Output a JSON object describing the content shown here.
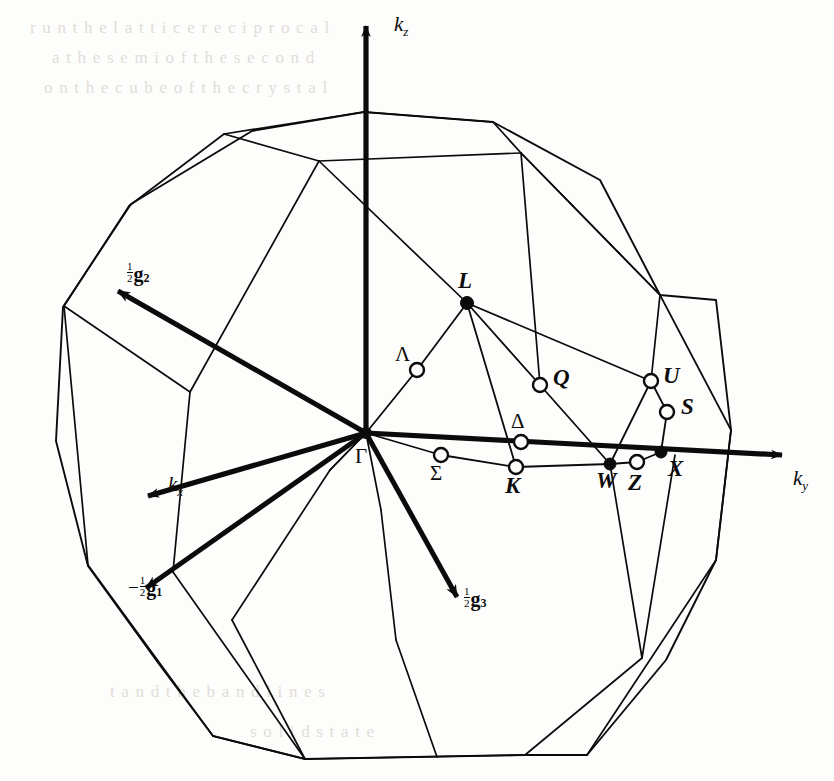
{
  "figure": {
    "type": "brillouin-zone-diagram",
    "lattice": "face-centred cubic",
    "zone_shape": "truncated octahedron",
    "background_color": "#fdfdfc",
    "ink_color": "#0b0b0b"
  },
  "axes": [
    {
      "id": "kz",
      "label": "k",
      "sub": "z",
      "label_x": 394,
      "label_y": 12,
      "from": [
        366,
        433
      ],
      "to": [
        366,
        26
      ],
      "style": "thick-arrow"
    },
    {
      "id": "ky",
      "label": "k",
      "sub": "y",
      "label_x": 793,
      "label_y": 466,
      "from": [
        366,
        433
      ],
      "to": [
        782,
        455
      ],
      "style": "thick-arrow"
    },
    {
      "id": "kx",
      "label": "k",
      "sub": "x",
      "label_x": 168,
      "label_y": 472,
      "from": [
        366,
        433
      ],
      "to": [
        148,
        496
      ],
      "style": "thick-arrow"
    }
  ],
  "reciprocal_vectors": [
    {
      "id": "half-g2",
      "sign": "",
      "numerator": "1",
      "denominator": "2",
      "symbol": "g",
      "subscript": "2",
      "label_x": 127,
      "label_y": 262,
      "from": [
        366,
        433
      ],
      "to": [
        118,
        291
      ]
    },
    {
      "id": "neg-half-g1",
      "sign": "−",
      "numerator": "1",
      "denominator": "2",
      "symbol": "g",
      "subscript": "1",
      "label_x": 128,
      "label_y": 576,
      "from": [
        366,
        433
      ],
      "to": [
        146,
        588
      ]
    },
    {
      "id": "half-g3",
      "sign": "",
      "numerator": "1",
      "denominator": "2",
      "symbol": "g",
      "subscript": "3",
      "label_x": 464,
      "label_y": 587,
      "from": [
        366,
        433
      ],
      "to": [
        457,
        597
      ]
    }
  ],
  "symmetry_points": [
    {
      "id": "gamma",
      "label": "Γ",
      "style": "greek",
      "marker": "filled",
      "x": 366,
      "y": 433,
      "label_x": 355,
      "label_y": 444,
      "r": 5.5
    },
    {
      "id": "L",
      "label": "L",
      "style": "italic",
      "marker": "filled",
      "x": 467,
      "y": 303,
      "label_x": 458,
      "label_y": 268,
      "r": 6.5
    },
    {
      "id": "W",
      "label": "W",
      "style": "italic",
      "marker": "filled",
      "x": 610,
      "y": 464,
      "label_x": 596,
      "label_y": 468,
      "r": 6.0
    },
    {
      "id": "X",
      "label": "X",
      "style": "italic",
      "marker": "filled",
      "x": 661,
      "y": 452,
      "label_x": 668,
      "label_y": 456,
      "r": 6.0
    },
    {
      "id": "lambda",
      "label": "Λ",
      "style": "greek",
      "marker": "open",
      "x": 417,
      "y": 370,
      "label_x": 395,
      "label_y": 342,
      "r": 7.0
    },
    {
      "id": "Q",
      "label": "Q",
      "style": "italic",
      "marker": "open",
      "x": 540,
      "y": 385,
      "label_x": 553,
      "label_y": 365,
      "r": 7.0
    },
    {
      "id": "U",
      "label": "U",
      "style": "italic",
      "marker": "open",
      "x": 651,
      "y": 381,
      "label_x": 663,
      "label_y": 363,
      "r": 7.0
    },
    {
      "id": "S",
      "label": "S",
      "style": "italic",
      "marker": "open",
      "x": 667,
      "y": 412,
      "label_x": 681,
      "label_y": 394,
      "r": 7.0
    },
    {
      "id": "delta",
      "label": "Δ",
      "style": "greek",
      "marker": "open",
      "x": 521,
      "y": 442,
      "label_x": 511,
      "label_y": 409,
      "r": 7.0
    },
    {
      "id": "sigma",
      "label": "Σ",
      "style": "greek",
      "marker": "open",
      "x": 441,
      "y": 455,
      "label_x": 430,
      "label_y": 461,
      "r": 7.0
    },
    {
      "id": "K",
      "label": "K",
      "style": "italic",
      "marker": "open",
      "x": 516,
      "y": 467,
      "label_x": 505,
      "label_y": 473,
      "r": 7.0
    },
    {
      "id": "Z",
      "label": "Z",
      "style": "italic",
      "marker": "open",
      "x": 637,
      "y": 462,
      "label_x": 628,
      "label_y": 470,
      "r": 7.0
    }
  ],
  "internal_lines": [
    {
      "id": "gamma-lambda-L",
      "points": [
        [
          366,
          433
        ],
        [
          417,
          370
        ],
        [
          467,
          303
        ]
      ]
    },
    {
      "id": "gamma-sigma-K",
      "points": [
        [
          366,
          433
        ],
        [
          441,
          455
        ],
        [
          516,
          467
        ]
      ]
    },
    {
      "id": "L-K",
      "points": [
        [
          467,
          303
        ],
        [
          516,
          467
        ]
      ]
    },
    {
      "id": "L-Q-W",
      "points": [
        [
          467,
          303
        ],
        [
          540,
          385
        ],
        [
          610,
          464
        ]
      ]
    },
    {
      "id": "L-U",
      "points": [
        [
          467,
          303
        ],
        [
          651,
          381
        ]
      ]
    },
    {
      "id": "K-W",
      "points": [
        [
          516,
          467
        ],
        [
          610,
          464
        ]
      ]
    },
    {
      "id": "U-S-X",
      "points": [
        [
          651,
          381
        ],
        [
          667,
          412
        ],
        [
          661,
          452
        ]
      ]
    },
    {
      "id": "W-Z-X",
      "points": [
        [
          610,
          464
        ],
        [
          637,
          462
        ],
        [
          661,
          452
        ]
      ]
    },
    {
      "id": "U-W",
      "points": [
        [
          651,
          381
        ],
        [
          610,
          464
        ]
      ]
    }
  ],
  "zone_outline": {
    "id": "truncated-octahedron",
    "silhouette": [
      [
        364,
        112
      ],
      [
        252,
        131
      ],
      [
        131,
        204
      ],
      [
        63,
        307
      ],
      [
        56,
        441
      ],
      [
        88,
        566
      ],
      [
        159,
        664
      ],
      [
        213,
        736
      ],
      [
        305,
        759
      ],
      [
        525,
        755
      ],
      [
        587,
        755
      ],
      [
        666,
        660
      ],
      [
        716,
        560
      ],
      [
        731,
        430
      ],
      [
        716,
        300
      ],
      [
        660,
        295
      ],
      [
        600,
        180
      ],
      [
        493,
        122
      ]
    ],
    "visible_edges": [
      {
        "id": "top-face-back-left",
        "points": [
          [
            224,
            134
          ],
          [
            364,
            112
          ]
        ]
      },
      {
        "id": "top-face-back-right",
        "points": [
          [
            364,
            112
          ],
          [
            493,
            122
          ]
        ]
      },
      {
        "id": "top-face-front-left",
        "points": [
          [
            224,
            134
          ],
          [
            319,
            161
          ]
        ]
      },
      {
        "id": "top-face-front",
        "points": [
          [
            319,
            161
          ],
          [
            521,
            153
          ]
        ]
      },
      {
        "id": "top-face-right",
        "points": [
          [
            493,
            122
          ],
          [
            521,
            153
          ]
        ]
      },
      {
        "id": "left-upper-edge",
        "points": [
          [
            224,
            134
          ],
          [
            129,
            206
          ]
        ]
      },
      {
        "id": "left-mid-edge",
        "points": [
          [
            129,
            206
          ],
          [
            64,
            306
          ]
        ]
      },
      {
        "id": "left-lower-edge",
        "points": [
          [
            64,
            306
          ],
          [
            88,
            565
          ]
        ]
      },
      {
        "id": "left-bottom-edge",
        "points": [
          [
            88,
            565
          ],
          [
            213,
            736
          ]
        ]
      },
      {
        "id": "bottom-left",
        "points": [
          [
            213,
            736
          ],
          [
            305,
            759
          ]
        ]
      },
      {
        "id": "bottom-mid",
        "points": [
          [
            305,
            759
          ],
          [
            525,
            755
          ]
        ]
      },
      {
        "id": "bottom-right",
        "points": [
          [
            525,
            755
          ],
          [
            587,
            755
          ]
        ]
      },
      {
        "id": "right-bottom-edge",
        "points": [
          [
            587,
            755
          ],
          [
            716,
            560
          ]
        ]
      },
      {
        "id": "right-mid-edge",
        "points": [
          [
            716,
            560
          ],
          [
            731,
            430
          ]
        ]
      },
      {
        "id": "right-upper-edge",
        "points": [
          [
            731,
            430
          ],
          [
            660,
            295
          ]
        ]
      },
      {
        "id": "right-top-edge",
        "points": [
          [
            660,
            295
          ],
          [
            521,
            153
          ]
        ]
      },
      {
        "id": "face-seam-hex-left",
        "points": [
          [
            64,
            306
          ],
          [
            190,
            392
          ]
        ]
      },
      {
        "id": "face-seam-left-v",
        "points": [
          [
            190,
            392
          ],
          [
            173,
            572
          ]
        ]
      },
      {
        "id": "face-seam-left-down",
        "points": [
          [
            173,
            572
          ],
          [
            305,
            759
          ]
        ]
      },
      {
        "id": "face-seam-front-l",
        "points": [
          [
            190,
            392
          ],
          [
            319,
            161
          ]
        ]
      },
      {
        "id": "face-seam-mid-v",
        "points": [
          [
            366,
            433
          ],
          [
            330,
            470
          ]
        ]
      },
      {
        "id": "face-seam-mid-left",
        "points": [
          [
            330,
            470
          ],
          [
            232,
            620
          ]
        ]
      },
      {
        "id": "face-seam-mid-down",
        "points": [
          [
            232,
            620
          ],
          [
            305,
            759
          ]
        ]
      },
      {
        "id": "face-seam-center-v",
        "points": [
          [
            330,
            470
          ],
          [
            366,
            433
          ]
        ]
      },
      {
        "id": "face-seam-gamma-down",
        "points": [
          [
            366,
            433
          ],
          [
            381,
            510
          ]
        ]
      },
      {
        "id": "face-seam-front-d",
        "points": [
          [
            381,
            510
          ],
          [
            396,
            640
          ]
        ]
      },
      {
        "id": "face-seam-front-b",
        "points": [
          [
            396,
            640
          ],
          [
            437,
            757
          ]
        ]
      },
      {
        "id": "face-seam-right-v",
        "points": [
          [
            610,
            464
          ],
          [
            642,
            658
          ]
        ]
      },
      {
        "id": "face-seam-right-d",
        "points": [
          [
            642,
            658
          ],
          [
            525,
            755
          ]
        ]
      },
      {
        "id": "face-seam-x-down",
        "points": [
          [
            675,
            455
          ],
          [
            642,
            658
          ]
        ]
      },
      {
        "id": "face-seam-upper-r",
        "points": [
          [
            521,
            153
          ],
          [
            660,
            295
          ]
        ]
      },
      {
        "id": "face-seam-u-up",
        "points": [
          [
            651,
            381
          ],
          [
            660,
            295
          ]
        ]
      },
      {
        "id": "face-seam-q-upper",
        "points": [
          [
            540,
            385
          ],
          [
            521,
            153
          ]
        ]
      },
      {
        "id": "face-seam-l-up",
        "points": [
          [
            467,
            303
          ],
          [
            319,
            161
          ]
        ]
      }
    ]
  },
  "bleed_through_text": [
    {
      "line": "r u n  t h e  l a t t i c e  r e c i p r o c a l",
      "x": 30,
      "y": 18
    },
    {
      "line": "a  t h e  s e m i  o f  t h e  s e c o n d",
      "x": 52,
      "y": 48
    },
    {
      "line": "o n  t h e  c u b e  o f  t h e  c r y s t a l",
      "x": 44,
      "y": 78
    },
    {
      "line": "t  a  n  d   t  h  e   b  a  n  d   l  i  n  e  s",
      "x": 110,
      "y": 682
    },
    {
      "line": "s  o  l  i  d   s  t  a  t  e",
      "x": 250,
      "y": 722
    }
  ]
}
